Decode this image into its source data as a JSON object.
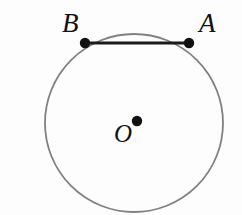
{
  "figure": {
    "kind": "geometry-diagram",
    "background_color": "#fdfdfd",
    "width": 242,
    "height": 215
  },
  "colors": {
    "circle_stroke": "#808080",
    "chord_stroke": "#1a1a1a",
    "point_fill": "#111111",
    "label_text": "#111111",
    "background": "#fdfdfd"
  },
  "circle": {
    "name": "main-circle",
    "center_x": 134,
    "center_y": 123,
    "radius": 89,
    "stroke_width": 1.8
  },
  "chord": {
    "name": "chord-AB",
    "x1": 85,
    "y1": 43,
    "x2": 189,
    "y2": 43,
    "stroke_width": 3
  },
  "points": [
    {
      "id": "A",
      "label": "A",
      "cx": 189,
      "cy": 43,
      "r": 5.2
    },
    {
      "id": "B",
      "label": "B",
      "cx": 85,
      "cy": 43,
      "r": 5.2
    },
    {
      "id": "O",
      "label": "O",
      "cx": 137,
      "cy": 121,
      "r": 5.2
    }
  ],
  "labels": {
    "a": "A",
    "b": "B",
    "o": "O"
  }
}
